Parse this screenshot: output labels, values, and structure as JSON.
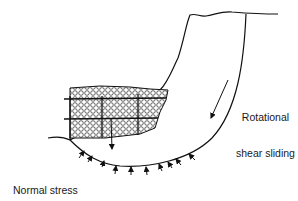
{
  "diagram": {
    "type": "geotechnical-cross-section",
    "labels": {
      "rotational": {
        "line1": "Rotational",
        "line2": "shear sliding"
      },
      "normal_stress": {
        "line1": "Normal stress",
        "line2": "due to buttress",
        "line3": "weight"
      }
    },
    "elements": [
      "slope-profile",
      "failure-arc",
      "gabion-buttress",
      "sliding-arrow",
      "buttress-weight-arrow",
      "normal-stress-arrows"
    ],
    "colors": {
      "stroke": "#111111",
      "background": "#ffffff"
    }
  }
}
